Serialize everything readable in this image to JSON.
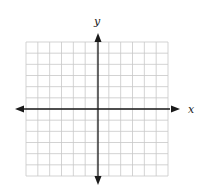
{
  "diagram": {
    "type": "coordinate-plane",
    "grid": {
      "columns": 12,
      "rows": 12,
      "line_color": "#c8c8c8"
    },
    "axes": {
      "x_label": "x",
      "y_label": "y",
      "color": "#1a1a1a",
      "arrows": [
        "left",
        "right",
        "up",
        "down"
      ]
    }
  }
}
